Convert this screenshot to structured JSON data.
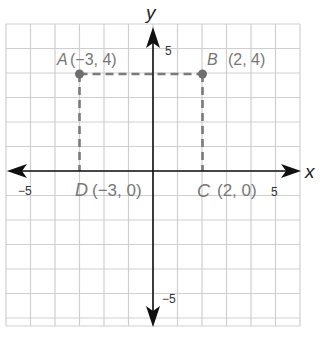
{
  "chart_data": {
    "type": "scatter",
    "title": "",
    "xlabel": "x",
    "ylabel": "y",
    "xlim": [
      -6,
      6
    ],
    "ylim": [
      -6,
      6
    ],
    "grid": true,
    "tick_labels": {
      "x": [
        {
          "value": -5,
          "label": "−5"
        },
        {
          "value": 5,
          "label": "5"
        }
      ],
      "y": [
        {
          "value": 5,
          "label": "5"
        },
        {
          "value": -5,
          "label": "−5"
        }
      ]
    },
    "points": [
      {
        "name": "A",
        "x": -3,
        "y": 4,
        "label": "(−3, 4)"
      },
      {
        "name": "B",
        "x": 2,
        "y": 4,
        "label": "(2, 4)"
      },
      {
        "name": "C",
        "x": 2,
        "y": 0,
        "label": "(2, 0)"
      },
      {
        "name": "D",
        "x": -3,
        "y": 0,
        "label": "(−3, 0)"
      }
    ],
    "dashed_segments": [
      {
        "from": "A",
        "to": "B"
      },
      {
        "from": "A",
        "to": "D"
      },
      {
        "from": "B",
        "to": "C"
      }
    ]
  },
  "axes": {
    "x_name": "x",
    "y_name": "y",
    "x_neg_tick": "−5",
    "x_pos_tick": "5",
    "y_pos_tick": "5",
    "y_neg_tick": "−5"
  },
  "points": {
    "A": {
      "letter": "A",
      "coords": "(−3, 4)"
    },
    "B": {
      "letter": "B",
      "coords": "(2, 4)"
    },
    "C": {
      "letter": "C",
      "coords": "(2, 0)"
    },
    "D": {
      "letter": "D",
      "coords": "(−3, 0)"
    }
  },
  "colors": {
    "grid": "#cfcfcf",
    "axis": "#111111",
    "point": "#7a7a7a",
    "dash": "#7a7a7a",
    "label": "#777777"
  }
}
